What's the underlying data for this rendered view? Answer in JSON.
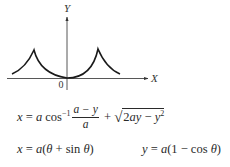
{
  "diagram": {
    "axes": {
      "x_label": "X",
      "y_label": "Y",
      "origin_label": "0"
    },
    "colors": {
      "curve": "#1a1a1a",
      "axis": "#333333",
      "background": "#ffffff"
    },
    "curve": {
      "description": "Cycloid arches with cusps at left and right, minimum at origin",
      "left_cusp": {
        "x": 34,
        "y": 50
      },
      "right_cusp": {
        "x": 98,
        "y": 49
      },
      "minimum": {
        "x": 67,
        "y": 78
      },
      "left_end": {
        "x": 12,
        "y": 74
      },
      "right_end": {
        "x": 120,
        "y": 74
      }
    }
  },
  "formulas": {
    "main": {
      "lhs": "x",
      "eq": " = ",
      "a1": "a",
      "cos": " cos",
      "inv": "−1",
      "frac_num_a": "a",
      "frac_num_rest": " − y",
      "frac_den": "a",
      "plus": " + ",
      "sqrt_symbol": "√",
      "radicand_pre": "2",
      "radicand_a": "ay",
      "radicand_minus": " − ",
      "radicand_y": "y",
      "radicand_exp": "2"
    },
    "param_x": {
      "lhs": "x",
      "eq": " = ",
      "a": "a",
      "open": "(",
      "theta1": "θ",
      "plus": " + sin ",
      "theta2": "θ",
      "close": ")"
    },
    "param_y": {
      "lhs": "y",
      "eq": " = ",
      "a": "a",
      "open": "(1 − cos ",
      "theta": "θ",
      "close": ")"
    }
  }
}
